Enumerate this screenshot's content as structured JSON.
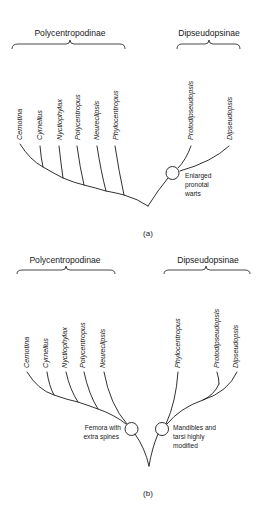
{
  "diagram_a": {
    "caption": "(a)",
    "groups": {
      "left": "Polycentropodinae",
      "right": "Dipseudopsinae"
    },
    "taxa": [
      "Cernotina",
      "Cyrnellus",
      "Nyctiophylax",
      "Polycentropus",
      "Neureclipsis",
      "Phylocentropus",
      "Protodipseudopsis",
      "Dipseudopsis"
    ],
    "node_annotation": [
      "Enlarged",
      "pronotal",
      "warts"
    ]
  },
  "diagram_b": {
    "caption": "(b)",
    "groups": {
      "left": "Polycentropodinae",
      "right": "Dipseudopsinae"
    },
    "taxa": [
      "Cernotina",
      "Cyrnellus",
      "Nyctiophylax",
      "Polycentropus",
      "Neureclipsis",
      "Phylocentropus",
      "Protodipseudopsis",
      "Dipseudopsis"
    ],
    "left_node_annotation": [
      "Femora with",
      "extra spines"
    ],
    "right_node_annotation": [
      "Mandibles and",
      "tarsi highly",
      "modified"
    ]
  }
}
